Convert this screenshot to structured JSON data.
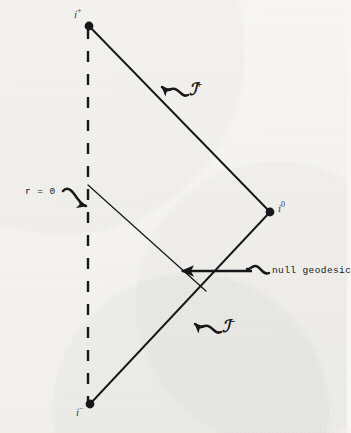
{
  "figure": {
    "kind": "penrose-conformal-diagram",
    "background_color": "#f4f3ef",
    "ink_color": "#17171a"
  },
  "labels": {
    "future_timelike_infinity": {
      "symbol": "i",
      "superscript": "+"
    },
    "spatial_infinity": {
      "symbol": "i",
      "superscript": "0"
    },
    "past_timelike_infinity": {
      "symbol": "i",
      "superscript": "−"
    },
    "origin_worldline": "r = 0",
    "future_null_infinity": {
      "symbol": "ℐ",
      "superscript": "+"
    },
    "past_null_infinity": {
      "symbol": "ℐ",
      "superscript": "−"
    },
    "null_geodesic": "null geodesic"
  },
  "geometry": {
    "vertices": {
      "i_plus": {
        "x": 89,
        "y": 26
      },
      "i_zero": {
        "x": 270,
        "y": 212
      },
      "i_minus": {
        "x": 90,
        "y": 404
      }
    },
    "dashed_worldline": {
      "x": 88,
      "y_top": 28,
      "y_bottom": 402,
      "dash": "10 11"
    },
    "null_geodesic_segment": {
      "x1": 88,
      "y1": 185,
      "x2": 206,
      "y2": 291
    },
    "scri_plus_edge": {
      "x1": 89,
      "y1": 26,
      "x2": 270,
      "y2": 212
    },
    "scri_minus_edge": {
      "x1": 270,
      "y1": 212,
      "x2": 90,
      "y2": 404
    }
  },
  "pointers": {
    "r0_arrow": {
      "from": {
        "x": 68,
        "y": 194
      },
      "to": {
        "x": 86,
        "y": 205
      },
      "style": "squiggle"
    },
    "scri_plus_arrow": {
      "from": {
        "x": 186,
        "y": 93
      },
      "to": {
        "x": 160,
        "y": 85
      },
      "style": "squiggle"
    },
    "scri_minus_arrow": {
      "from": {
        "x": 219,
        "y": 330
      },
      "to": {
        "x": 193,
        "y": 318
      },
      "style": "squiggle"
    },
    "null_geodesic_arrow": {
      "from": {
        "x": 268,
        "y": 272
      },
      "to": {
        "x": 181,
        "y": 272
      },
      "style": "straight-with-squiggle-tail"
    }
  }
}
